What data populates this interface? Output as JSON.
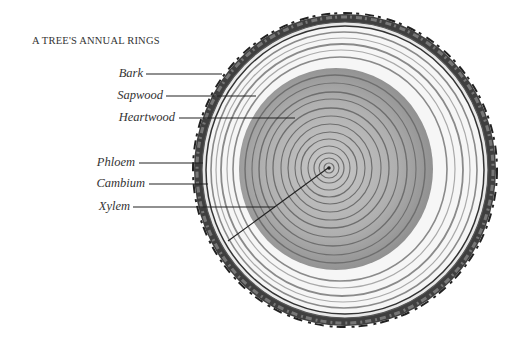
{
  "title": "A TREE'S ANNUAL RINGS",
  "labels": [
    {
      "id": "bark",
      "text": "Bark"
    },
    {
      "id": "sapwood",
      "text": "Sapwood"
    },
    {
      "id": "heartwood",
      "text": "Heartwood"
    },
    {
      "id": "phloem",
      "text": "Phloem"
    },
    {
      "id": "cambium",
      "text": "Cambium"
    },
    {
      "id": "xylem",
      "text": "Xylem"
    }
  ],
  "colors": {
    "bark": "#3a3a3a",
    "sapwood": "#f4f4f4",
    "heartwood": "#9a9a9a",
    "ring_line": "#6a6a6a",
    "leader": "#222222",
    "text": "#333333"
  }
}
